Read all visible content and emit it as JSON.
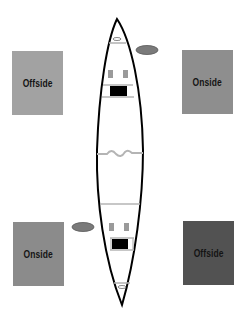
{
  "diagram": {
    "boxes": [
      {
        "id": "top-left",
        "label": "Offside",
        "color": "#a2a2a2",
        "x": 12,
        "y": 51,
        "w": 51,
        "h": 64
      },
      {
        "id": "top-right",
        "label": "Onside",
        "color": "#8e8e8e",
        "x": 182,
        "y": 50,
        "w": 51,
        "h": 64
      },
      {
        "id": "bottom-left",
        "label": "Onside",
        "color": "#8b8b8b",
        "x": 13,
        "y": 222,
        "w": 51,
        "h": 64
      },
      {
        "id": "bottom-right",
        "label": "Offside",
        "color": "#525252",
        "x": 183,
        "y": 221,
        "w": 51,
        "h": 64
      }
    ],
    "canoe": {
      "outline_color": "#000000",
      "trim_color": "#b4b4b4",
      "seat_color": "#000000",
      "thwart_color": "#9a9a9a"
    },
    "paddles": [
      {
        "id": "bow-paddle",
        "side": "right",
        "color": "#7a7a7a"
      },
      {
        "id": "stern-paddle",
        "side": "left",
        "color": "#7a7a7a"
      }
    ]
  }
}
